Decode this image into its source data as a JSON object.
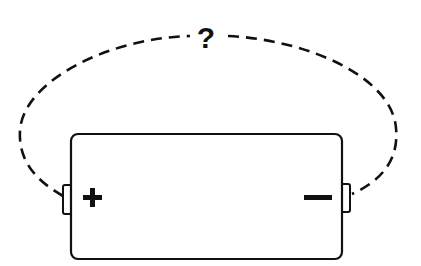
{
  "diagram": {
    "loop_label": "?",
    "battery": {
      "positive_symbol": "+",
      "negative_symbol": "−"
    },
    "colors": {
      "stroke": "#111111",
      "background": "#ffffff"
    }
  }
}
